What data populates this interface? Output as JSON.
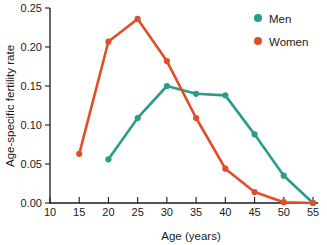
{
  "chart_data": {
    "type": "line",
    "title": "",
    "xlabel": "Age (years)",
    "ylabel": "Age-specific fertility rate",
    "x": [
      10,
      15,
      20,
      25,
      30,
      35,
      40,
      45,
      50,
      55
    ],
    "xlim": [
      10,
      55
    ],
    "ylim": [
      0.0,
      0.25
    ],
    "xticks": [
      "10",
      "15",
      "20",
      "25",
      "30",
      "35",
      "40",
      "45",
      "50",
      "55"
    ],
    "yticks": [
      "0.00",
      "0.05",
      "0.10",
      "0.15",
      "0.20",
      "0.25"
    ],
    "grid": false,
    "legend_position": "top-right",
    "series": [
      {
        "name": "Men",
        "color": "#2a9d8a",
        "x": [
          20,
          25,
          30,
          35,
          40,
          45,
          50,
          55
        ],
        "values": [
          0.056,
          0.109,
          0.15,
          0.14,
          0.138,
          0.088,
          0.035,
          0.0
        ]
      },
      {
        "name": "Women",
        "color": "#e04e29",
        "x": [
          15,
          20,
          25,
          30,
          35,
          40,
          45,
          50,
          55
        ],
        "values": [
          0.063,
          0.207,
          0.236,
          0.182,
          0.109,
          0.044,
          0.014,
          0.001,
          0.0
        ]
      }
    ]
  },
  "legend": {
    "items": [
      {
        "label": "Men",
        "color": "#2a9d8a"
      },
      {
        "label": "Women",
        "color": "#e04e29"
      }
    ]
  },
  "axes": {
    "x_title": "Age (years)",
    "y_title": "Age-specific fertility rate"
  }
}
